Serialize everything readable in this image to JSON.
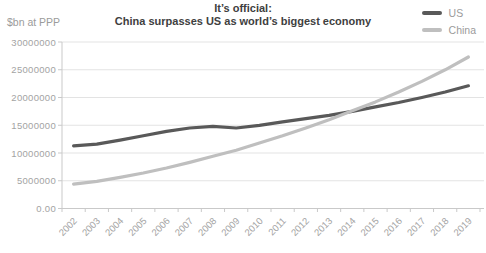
{
  "title": {
    "line1": "It’s official:",
    "line2": "China surpasses US as world’s biggest economy"
  },
  "y_axis_unit": "$bn at PPP",
  "legend": [
    {
      "name": "US",
      "color": "#595959"
    },
    {
      "name": "China",
      "color": "#bfbfbf"
    }
  ],
  "colors": {
    "title_text": "#404040",
    "axis_text": "#a3a3a3",
    "gridline": "#e3e3e3",
    "axis_line": "#c9c9c9",
    "us_line": "#595959",
    "china_line": "#bfbfbf",
    "background": "#ffffff"
  },
  "chart_data": {
    "type": "line",
    "title": "It’s official: China surpasses US as world’s biggest economy",
    "ylabel": "$bn at PPP",
    "xlabel": "",
    "grid": "horizontal",
    "legend_position": "top-right",
    "ylim": [
      0,
      30000000
    ],
    "y_ticks": [
      0,
      5000000,
      10000000,
      15000000,
      20000000,
      25000000,
      30000000
    ],
    "y_tick_labels": [
      "0.00",
      "5000000",
      "10000000",
      "15000000",
      "20000000",
      "25000000",
      "30000000"
    ],
    "x": [
      "2002",
      "2003",
      "2004",
      "2005",
      "2006",
      "2007",
      "2008",
      "2009",
      "2010",
      "2011",
      "2012",
      "2013",
      "2014",
      "2015",
      "2016",
      "2017",
      "2018",
      "2019"
    ],
    "series": [
      {
        "name": "US",
        "color": "#595959",
        "values": [
          11300000,
          11600000,
          12300000,
          13100000,
          13900000,
          14500000,
          14800000,
          14500000,
          15000000,
          15600000,
          16200000,
          16800000,
          17500000,
          18300000,
          19100000,
          20000000,
          21000000,
          22100000
        ]
      },
      {
        "name": "China",
        "color": "#bfbfbf",
        "values": [
          4400000,
          4900000,
          5600000,
          6400000,
          7300000,
          8300000,
          9400000,
          10500000,
          11800000,
          13100000,
          14500000,
          16000000,
          17600000,
          19200000,
          21000000,
          22900000,
          25000000,
          27300000
        ]
      }
    ]
  }
}
